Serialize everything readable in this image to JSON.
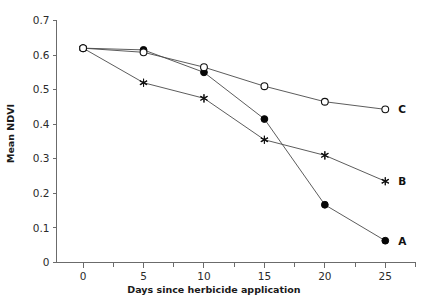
{
  "chart_data": {
    "type": "line",
    "title": "",
    "xlabel": "Days since herbicide application",
    "ylabel": "Mean NDVI",
    "x": [
      0,
      5,
      10,
      15,
      20,
      25
    ],
    "xlim": [
      -2.2,
      27.5
    ],
    "ylim": [
      0,
      0.7
    ],
    "xticks": [
      0,
      5,
      10,
      15,
      20,
      25
    ],
    "xtick_labels": [
      "0",
      "5",
      "10",
      "15",
      "20",
      "25"
    ],
    "x_minor_ticks": [
      -2.5,
      2.5,
      7.5,
      12.5,
      17.5,
      22.5,
      27.5
    ],
    "yticks": [
      0,
      0.1,
      0.2,
      0.3,
      0.4,
      0.5,
      0.6,
      0.7
    ],
    "ytick_labels": [
      "0",
      "0.1",
      "0.2",
      "0.3",
      "0.4",
      "0.5",
      "0.6",
      "0.7"
    ],
    "grid": false,
    "legend_position": "right-inline-labels",
    "series": [
      {
        "name": "A",
        "marker": "filled-circle",
        "label": "A",
        "values": [
          0.62,
          0.615,
          0.55,
          0.415,
          0.167,
          0.063
        ]
      },
      {
        "name": "B",
        "marker": "star",
        "label": "B",
        "values": [
          0.62,
          0.52,
          0.475,
          0.355,
          0.31,
          0.235
        ]
      },
      {
        "name": "C",
        "marker": "open-circle",
        "label": "C",
        "values": [
          0.62,
          0.608,
          0.565,
          0.51,
          0.465,
          0.443
        ]
      }
    ],
    "colors": {
      "line": "#4a4a4a",
      "axis": "#6b6b6b",
      "text": "#1a1a1a",
      "marker_fill": "#060606",
      "marker_open_fill": "#ffffff"
    }
  }
}
